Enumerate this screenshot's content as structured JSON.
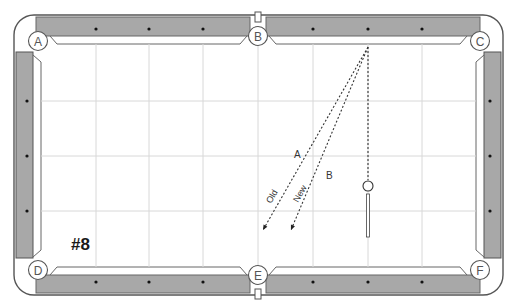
{
  "diagram": {
    "number_label": "#8",
    "colors": {
      "rail_fill": "#a8a8a8",
      "rail_edge": "#555555",
      "felt": "#ffffff",
      "grid": "#d8d8d8",
      "diamond": "#111111",
      "cushion_line": "#666666",
      "shot_line": "#333333"
    },
    "pockets": [
      {
        "label": "A",
        "x": 38,
        "y": 41
      },
      {
        "label": "B",
        "x": 258,
        "y": 36
      },
      {
        "label": "C",
        "x": 480,
        "y": 41
      },
      {
        "label": "D",
        "x": 38,
        "y": 270
      },
      {
        "label": "E",
        "x": 258,
        "y": 275
      },
      {
        "label": "F",
        "x": 480,
        "y": 270
      }
    ],
    "shots": [
      {
        "id": "old",
        "line_label": "Old",
        "point_label": "A",
        "from": [
          368,
          47
        ],
        "to": [
          263,
          230
        ]
      },
      {
        "id": "new",
        "line_label": "New",
        "point_label": "B",
        "from": [
          368,
          47
        ],
        "to": [
          291,
          230
        ]
      },
      {
        "id": "cue",
        "line_label": "",
        "point_label": "",
        "from": [
          368,
          47
        ],
        "to": [
          368,
          180
        ]
      }
    ],
    "cue_ball": {
      "x": 368,
      "y": 186,
      "r": 5
    },
    "cue_stick": {
      "x": 368,
      "y_top": 194,
      "y_bottom": 237
    },
    "point_label_positions": {
      "A": [
        294,
        158
      ],
      "B": [
        326,
        179
      ]
    },
    "line_label_positions": {
      "Old": [
        271,
        204,
        -60
      ],
      "New": [
        298,
        203,
        -60
      ]
    },
    "diamonds": {
      "top": [
        [
          96,
          29
        ],
        [
          149,
          29
        ],
        [
          203,
          29
        ],
        [
          313,
          29
        ],
        [
          368,
          29
        ],
        [
          422,
          29
        ]
      ],
      "bottom": [
        [
          96,
          282
        ],
        [
          149,
          282
        ],
        [
          203,
          282
        ],
        [
          313,
          282
        ],
        [
          368,
          282
        ],
        [
          422,
          282
        ]
      ],
      "left": [
        [
          27,
          101
        ],
        [
          27,
          156
        ],
        [
          27,
          211
        ]
      ],
      "right": [
        [
          490,
          101
        ],
        [
          490,
          156
        ],
        [
          490,
          211
        ]
      ]
    },
    "grid": {
      "vertical": [
        96,
        149,
        203,
        258,
        313,
        368,
        422
      ],
      "horizontal": [
        101,
        156,
        211
      ]
    }
  }
}
